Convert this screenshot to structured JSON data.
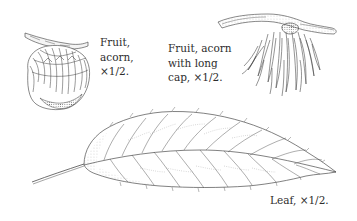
{
  "plate": {
    "figures": [
      {
        "id": "acorn",
        "caption_lines": [
          "Fruit,",
          "acorn,",
          "×1/2."
        ]
      },
      {
        "id": "acorn-long-cap",
        "caption_lines": [
          "Fruit, acorn",
          "with long",
          "cap, ×1/2."
        ]
      },
      {
        "id": "leaf",
        "caption_lines": [
          "Leaf, ×1/2."
        ]
      }
    ],
    "colors": {
      "background": "#ffffff",
      "ink": "#3a3a3a",
      "text": "#2d2d2d"
    }
  }
}
